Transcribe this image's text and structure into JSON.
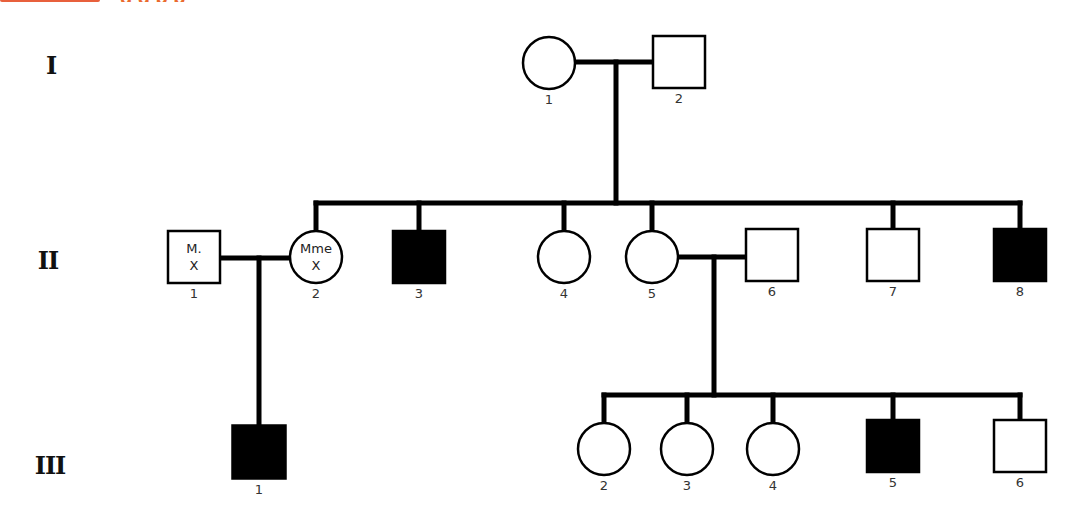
{
  "header": {
    "title_fragment": "g     g    p                                       p",
    "accent_color": "#ea6a2e"
  },
  "generations": [
    {
      "label": "I",
      "x": 51,
      "y": 65
    },
    {
      "label": "II",
      "x": 48,
      "y": 260
    },
    {
      "label": "III",
      "x": 50,
      "y": 465
    }
  ],
  "legend": {
    "affected_fill": "#000000",
    "unaffected_fill": "#ffffff",
    "stroke": "#000000"
  },
  "individuals": [
    {
      "id": "I-1",
      "gen": "I",
      "num": "1",
      "sex": "female",
      "affected": false,
      "cx": 549,
      "cy": 63,
      "size": 52
    },
    {
      "id": "I-2",
      "gen": "I",
      "num": "2",
      "sex": "male",
      "affected": false,
      "cx": 679,
      "cy": 62,
      "size": 52
    },
    {
      "id": "II-1",
      "gen": "II",
      "num": "1",
      "sex": "male",
      "affected": false,
      "cx": 194,
      "cy": 257,
      "size": 52,
      "inner": [
        "M.",
        "X"
      ]
    },
    {
      "id": "II-2",
      "gen": "II",
      "num": "2",
      "sex": "female",
      "affected": false,
      "cx": 316,
      "cy": 257,
      "size": 52,
      "inner": [
        "Mme",
        "X"
      ]
    },
    {
      "id": "II-3",
      "gen": "II",
      "num": "3",
      "sex": "male",
      "affected": true,
      "cx": 419,
      "cy": 257,
      "size": 52
    },
    {
      "id": "II-4",
      "gen": "II",
      "num": "4",
      "sex": "female",
      "affected": false,
      "cx": 564,
      "cy": 257,
      "size": 52
    },
    {
      "id": "II-5",
      "gen": "II",
      "num": "5",
      "sex": "female",
      "affected": false,
      "cx": 652,
      "cy": 257,
      "size": 52
    },
    {
      "id": "II-6",
      "gen": "II",
      "num": "6",
      "sex": "male",
      "affected": false,
      "cx": 772,
      "cy": 255,
      "size": 52
    },
    {
      "id": "II-7",
      "gen": "II",
      "num": "7",
      "sex": "male",
      "affected": false,
      "cx": 893,
      "cy": 255,
      "size": 52
    },
    {
      "id": "II-8",
      "gen": "II",
      "num": "8",
      "sex": "male",
      "affected": true,
      "cx": 1020,
      "cy": 255,
      "size": 52
    },
    {
      "id": "III-1",
      "gen": "III",
      "num": "1",
      "sex": "male",
      "affected": true,
      "cx": 259,
      "cy": 452,
      "size": 53
    },
    {
      "id": "III-2",
      "gen": "III",
      "num": "2",
      "sex": "female",
      "affected": false,
      "cx": 604,
      "cy": 449,
      "size": 52
    },
    {
      "id": "III-3",
      "gen": "III",
      "num": "3",
      "sex": "female",
      "affected": false,
      "cx": 687,
      "cy": 449,
      "size": 52
    },
    {
      "id": "III-4",
      "gen": "III",
      "num": "4",
      "sex": "female",
      "affected": false,
      "cx": 773,
      "cy": 449,
      "size": 52
    },
    {
      "id": "III-5",
      "gen": "III",
      "num": "5",
      "sex": "male",
      "affected": true,
      "cx": 893,
      "cy": 446,
      "size": 52
    },
    {
      "id": "III-6",
      "gen": "III",
      "num": "6",
      "sex": "male",
      "affected": false,
      "cx": 1020,
      "cy": 446,
      "size": 52
    }
  ],
  "lines": [
    {
      "name": "marriage-I1-I2",
      "x1": 575,
      "y1": 62,
      "x2": 653,
      "y2": 62
    },
    {
      "name": "descent-I",
      "x1": 616,
      "y1": 62,
      "x2": 616,
      "y2": 203
    },
    {
      "name": "sibship-II",
      "x1": 316,
      "y1": 203,
      "x2": 1020,
      "y2": 203
    },
    {
      "name": "drop-II-2",
      "x1": 316,
      "y1": 203,
      "x2": 316,
      "y2": 231
    },
    {
      "name": "drop-II-3",
      "x1": 419,
      "y1": 203,
      "x2": 419,
      "y2": 231
    },
    {
      "name": "drop-II-4",
      "x1": 564,
      "y1": 203,
      "x2": 564,
      "y2": 231
    },
    {
      "name": "drop-II-5",
      "x1": 652,
      "y1": 203,
      "x2": 652,
      "y2": 231
    },
    {
      "name": "drop-II-7",
      "x1": 893,
      "y1": 203,
      "x2": 893,
      "y2": 229
    },
    {
      "name": "drop-II-8",
      "x1": 1020,
      "y1": 203,
      "x2": 1020,
      "y2": 229
    },
    {
      "name": "marriage-II1-II2",
      "x1": 220,
      "y1": 258,
      "x2": 290,
      "y2": 258
    },
    {
      "name": "descent-II1-II2",
      "x1": 259,
      "y1": 258,
      "x2": 259,
      "y2": 426
    },
    {
      "name": "marriage-II5-II6",
      "x1": 678,
      "y1": 257,
      "x2": 746,
      "y2": 257
    },
    {
      "name": "descent-II5-II6",
      "x1": 714,
      "y1": 257,
      "x2": 714,
      "y2": 395
    },
    {
      "name": "sibship-III",
      "x1": 604,
      "y1": 395,
      "x2": 1020,
      "y2": 395
    },
    {
      "name": "drop-III-2",
      "x1": 604,
      "y1": 395,
      "x2": 604,
      "y2": 423
    },
    {
      "name": "drop-III-3",
      "x1": 687,
      "y1": 395,
      "x2": 687,
      "y2": 423
    },
    {
      "name": "drop-III-4",
      "x1": 773,
      "y1": 395,
      "x2": 773,
      "y2": 423
    },
    {
      "name": "drop-III-5",
      "x1": 893,
      "y1": 395,
      "x2": 893,
      "y2": 420
    },
    {
      "name": "drop-III-6",
      "x1": 1020,
      "y1": 395,
      "x2": 1020,
      "y2": 420
    }
  ]
}
